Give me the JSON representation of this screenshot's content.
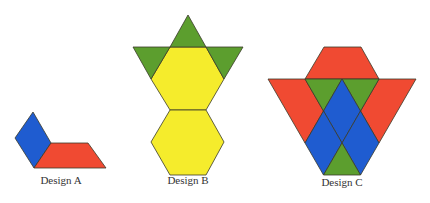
{
  "colors": {
    "blue": "#1f5cd0",
    "red": "#f04a32",
    "green": "#5c9e2e",
    "yellow": "#f5ec2c"
  },
  "designs": [
    {
      "label": "Design A",
      "pieces": [
        {
          "shape": "blue-rhombus",
          "color": "blue"
        },
        {
          "shape": "red-trapezoid",
          "color": "red"
        }
      ]
    },
    {
      "label": "Design B",
      "pieces": [
        {
          "shape": "green-triangle",
          "color": "green"
        },
        {
          "shape": "green-triangle",
          "color": "green"
        },
        {
          "shape": "green-triangle",
          "color": "green"
        },
        {
          "shape": "yellow-hexagon",
          "color": "yellow"
        },
        {
          "shape": "yellow-hexagon",
          "color": "yellow"
        }
      ]
    },
    {
      "label": "Design C",
      "pieces": [
        {
          "shape": "red-trapezoid",
          "color": "red"
        },
        {
          "shape": "red-trapezoid",
          "color": "red"
        },
        {
          "shape": "red-trapezoid",
          "color": "red"
        },
        {
          "shape": "green-triangle",
          "color": "green"
        },
        {
          "shape": "green-triangle",
          "color": "green"
        },
        {
          "shape": "green-triangle",
          "color": "green"
        },
        {
          "shape": "blue-rhombus",
          "color": "blue"
        },
        {
          "shape": "blue-rhombus",
          "color": "blue"
        },
        {
          "shape": "blue-rhombus",
          "color": "blue"
        }
      ]
    }
  ]
}
